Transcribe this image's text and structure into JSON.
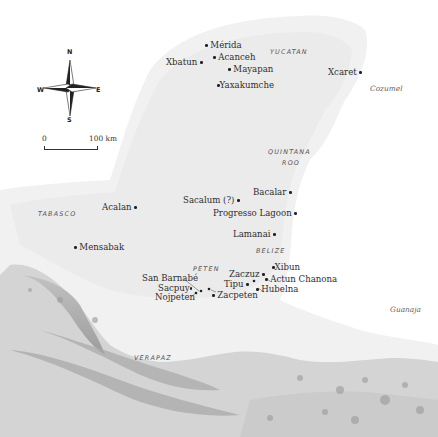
{
  "map": {
    "compass": {
      "n": "N",
      "s": "S",
      "e": "E",
      "w": "W"
    },
    "scale": {
      "start": "0",
      "end": "100 km"
    },
    "regions": [
      {
        "label": "YUCATAN"
      },
      {
        "label": "QUINTANA"
      },
      {
        "label": "ROO"
      },
      {
        "label": "TABASCO"
      },
      {
        "label": "BELIZE"
      },
      {
        "label": "PETEN"
      },
      {
        "label": "VERAPAZ"
      }
    ],
    "islands": [
      {
        "label": "Cozumel"
      },
      {
        "label": "Guanaja"
      }
    ],
    "sites": [
      {
        "name": "Mérida"
      },
      {
        "name": "Acanceh"
      },
      {
        "name": "Xbatun"
      },
      {
        "name": "Mayapan"
      },
      {
        "name": "Yaxakumche"
      },
      {
        "name": "Xcaret"
      },
      {
        "name": "Bacalar"
      },
      {
        "name": "Sacalum (?)"
      },
      {
        "name": "Progresso Lagoon"
      },
      {
        "name": "Acalan"
      },
      {
        "name": "Lamanai"
      },
      {
        "name": "Mensabak"
      },
      {
        "name": "Xibun"
      },
      {
        "name": "Zaczuz"
      },
      {
        "name": "Actun Chanona"
      },
      {
        "name": "San Barnabé"
      },
      {
        "name": "Tipu"
      },
      {
        "name": "Hubelna"
      },
      {
        "name": "Sacpuy"
      },
      {
        "name": "Nojpeten"
      },
      {
        "name": "Zacpeten"
      }
    ]
  }
}
